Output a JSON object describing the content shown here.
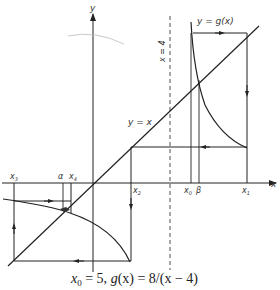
{
  "figure": {
    "caption_parts": {
      "x": "x",
      "sub0": "0",
      "rest": " = 5, ",
      "g": "g",
      "gx": "(x) = 8/(x − 4)"
    },
    "axes": {
      "x_label": "x",
      "y_label": "y"
    },
    "curves": {
      "g_label": "y = g(x)",
      "identity_label": "y = x",
      "asymptote_label": "x = 4"
    },
    "points": {
      "x0": "x",
      "x0_sub": "0",
      "x1": "x",
      "x1_sub": "1",
      "x2": "x",
      "x2_sub": "2",
      "x3": "x",
      "x3_sub": "3",
      "x4": "x",
      "x4_sub": "4",
      "alpha": "α",
      "beta": "β"
    },
    "colors": {
      "line": "#222222",
      "background": "#ffffff"
    }
  }
}
